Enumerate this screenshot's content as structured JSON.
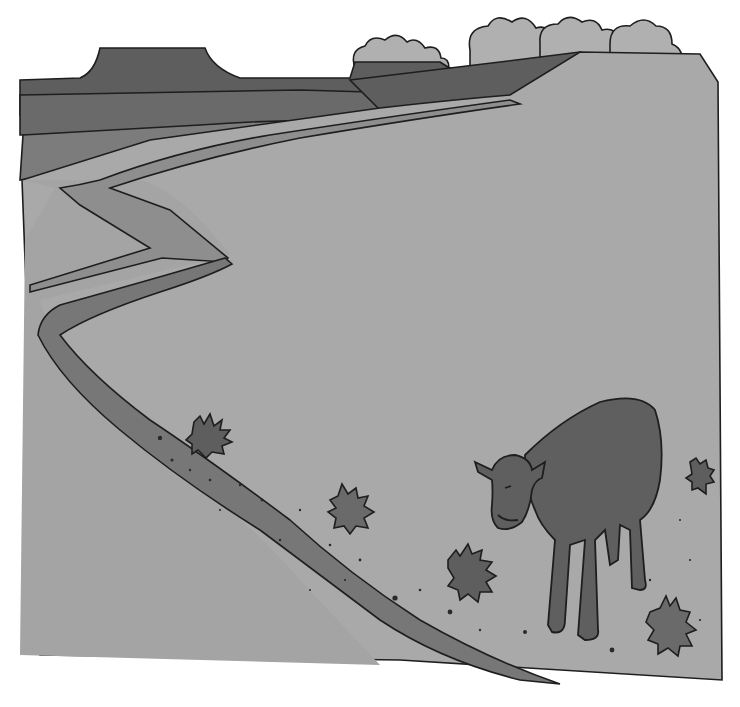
{
  "scene": {
    "description": "Grayscale illustration of a cow standing on a dry plain beside a winding riverbed, with mesas and clouds on the horizon",
    "colors": {
      "background": "#ffffff",
      "ground": "#a9a9a9",
      "mesa_dark": "#5e5e5e",
      "mesa_mid": "#6e6e6e",
      "mesa_light": "#7c7c7c",
      "riverbed": "#777777",
      "cloud": "#b0b0b0",
      "cow": "#5f5f5f",
      "tumbleweed": "#6a6a6a",
      "outline": "#1e1e1e"
    },
    "elements": [
      "mesas",
      "clouds",
      "river",
      "cow",
      "tumbleweeds",
      "pebbles"
    ]
  }
}
